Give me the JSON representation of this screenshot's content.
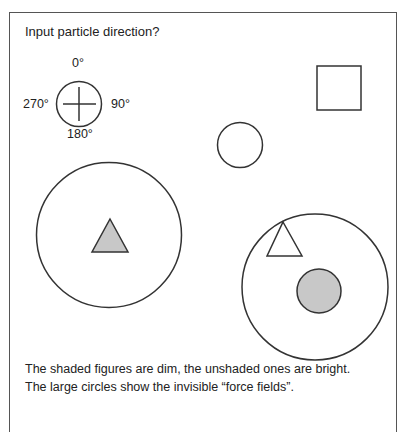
{
  "prompt": "Input particle direction?",
  "compass": {
    "labels": {
      "north": "0°",
      "east": "90°",
      "south": "180°",
      "west": "270°"
    }
  },
  "shapes": {
    "square": {
      "fill": "#ffffff",
      "state": "bright"
    },
    "small_circle": {
      "fill": "#ffffff",
      "state": "bright"
    },
    "left_force_field": {
      "kind": "large circle"
    },
    "left_triangle": {
      "fill": "#c8c8c8",
      "state": "dim"
    },
    "right_force_field": {
      "kind": "large circle"
    },
    "right_triangle": {
      "fill": "#ffffff",
      "state": "bright"
    },
    "right_gray_circle": {
      "fill": "#c8c8c8",
      "state": "dim"
    }
  },
  "caption": {
    "line1": "The shaded figures are dim, the unshaded ones are bright.",
    "line2": "The large circles show the invisible “force fields”."
  },
  "colors": {
    "stroke": "#333333",
    "shade": "#c8c8c8",
    "frame": "#555555"
  }
}
